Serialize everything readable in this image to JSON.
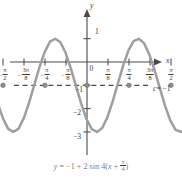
{
  "figure": {
    "title": "",
    "equation_label": "y = −1 + 2 sin 4(x + π/4)",
    "midline_label_c": "c",
    "midline_label_eq": "= −1",
    "axis_x_name": "x",
    "axis_y_name": "y",
    "origin_label": "0"
  },
  "x_ticks": [
    {
      "label": "−π/2",
      "sign": "−",
      "num": "π",
      "den": "2",
      "value": -1.5707963
    },
    {
      "label": "−3π/8",
      "sign": "−",
      "num": "3π",
      "den": "8",
      "value": -1.1780972
    },
    {
      "label": "−π/4",
      "sign": "−",
      "num": "π",
      "den": "4",
      "value": -0.7853982
    },
    {
      "label": "−π/8",
      "sign": "−",
      "num": "π",
      "den": "8",
      "value": -0.3926991
    },
    {
      "label": "π/8",
      "sign": "",
      "num": "π",
      "den": "8",
      "value": 0.3926991
    },
    {
      "label": "π/4",
      "sign": "",
      "num": "π",
      "den": "4",
      "value": 0.7853982
    },
    {
      "label": "3π/8",
      "sign": "",
      "num": "3π",
      "den": "8",
      "value": 1.1780972
    },
    {
      "label": "π/2",
      "sign": "",
      "num": "π",
      "den": "2",
      "value": 1.5707963
    }
  ],
  "y_ticks": [
    {
      "label": "1",
      "value": 1
    },
    {
      "label": "−1",
      "value": -1
    },
    {
      "label": "−2",
      "value": -2
    },
    {
      "label": "−3",
      "value": -3
    }
  ],
  "colors": {
    "curve": "#9e9e9e",
    "axis": "#4a4a4a",
    "midline": "#4a4a4a",
    "text": "#2e2e2e",
    "equation_text": "#7d7d7d",
    "background": "#ffffff"
  },
  "chart_data": {
    "type": "line",
    "title": "",
    "subtitle": "",
    "xlabel": "x",
    "ylabel": "y",
    "xlim": [
      -1.7671459,
      1.7671459
    ],
    "ylim": [
      -3.6,
      1.5
    ],
    "grid": false,
    "legend": null,
    "function": "y = -1 + 2*sin(4*(x + pi/4))",
    "amplitude": 2,
    "vertical_shift": -1,
    "period": 1.5707963,
    "phase_shift": -0.7853982,
    "midline": -1,
    "max": 1,
    "min": -3,
    "annotations": [
      {
        "text": "c = −1",
        "type": "midline-dashed",
        "y": -1
      }
    ],
    "marked_points": [
      {
        "x": -1.5707963,
        "y": -1
      },
      {
        "x": -0.7853982,
        "y": -1
      },
      {
        "x": 0,
        "y": -1
      },
      {
        "x": 0.7853982,
        "y": -1
      },
      {
        "x": 1.5707963,
        "y": -1
      }
    ],
    "x_tick_values": [
      -1.5707963,
      -1.1780972,
      -0.7853982,
      -0.3926991,
      0.3926991,
      0.7853982,
      1.1780972,
      1.5707963
    ],
    "x_tick_labels": [
      "−π/2",
      "−3π/8",
      "−π/4",
      "−π/8",
      "π/8",
      "π/4",
      "3π/8",
      "π/2"
    ],
    "y_tick_values": [
      1,
      -1,
      -2,
      -3
    ],
    "y_tick_labels": [
      "1",
      "−1",
      "−2",
      "−3"
    ],
    "series": [
      {
        "name": "y = -1 + 2 sin 4(x + pi/4)",
        "color": "#9e9e9e",
        "points": [
          {
            "x": -1.767146,
            "y": -1.0
          },
          {
            "x": -1.669436,
            "y": -1.765
          },
          {
            "x": -1.571726,
            "y": -2.42
          },
          {
            "x": -1.474017,
            "y": -2.868
          },
          {
            "x": -1.376307,
            "y": -3.0
          },
          {
            "x": -1.278597,
            "y": -2.859
          },
          {
            "x": -1.180888,
            "y": -2.405
          },
          {
            "x": -1.083178,
            "y": -1.746
          },
          {
            "x": -0.985468,
            "y": -0.98
          },
          {
            "x": -0.887759,
            "y": -0.215
          },
          {
            "x": -0.790049,
            "y": 0.434
          },
          {
            "x": -0.692339,
            "y": 0.873
          },
          {
            "x": -0.59463,
            "y": 0.999
          },
          {
            "x": -0.49692,
            "y": 0.846
          },
          {
            "x": -0.39921,
            "y": 0.383
          },
          {
            "x": -0.301501,
            "y": -0.282
          },
          {
            "x": -0.203791,
            "y": -1.046
          },
          {
            "x": -0.106081,
            "y": -1.81
          },
          {
            "x": -0.008372,
            "y": -2.453
          },
          {
            "x": 0.089338,
            "y": -2.884
          },
          {
            "x": 0.187048,
            "y": -3.0
          },
          {
            "x": 0.284757,
            "y": -2.834
          },
          {
            "x": 0.382467,
            "y": -2.361
          },
          {
            "x": 0.480177,
            "y": -1.69
          },
          {
            "x": 0.577886,
            "y": -0.922
          },
          {
            "x": 0.675596,
            "y": -0.156
          },
          {
            "x": 0.773306,
            "y": 0.49
          },
          {
            "x": 0.871015,
            "y": 0.9
          },
          {
            "x": 0.968725,
            "y": 0.996
          },
          {
            "x": 1.066435,
            "y": 0.811
          },
          {
            "x": 1.164144,
            "y": 0.33
          },
          {
            "x": 1.261854,
            "y": -0.337
          },
          {
            "x": 1.359564,
            "y": -1.099
          },
          {
            "x": 1.457273,
            "y": -1.86
          },
          {
            "x": 1.554983,
            "y": -2.491
          },
          {
            "x": 1.652693,
            "y": -2.906
          },
          {
            "x": 1.750402,
            "y": -2.998
          },
          {
            "x": 1.767146,
            "y": -2.985
          }
        ]
      }
    ]
  }
}
